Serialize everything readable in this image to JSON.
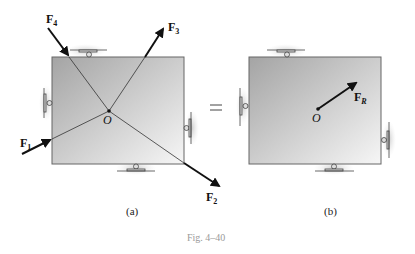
{
  "figure": {
    "caption": "Fig. 4–40",
    "equals_sign": "=",
    "panel_a": {
      "label": "(a)",
      "point_label": "O",
      "forces": [
        {
          "name": "F",
          "sub": "1"
        },
        {
          "name": "F",
          "sub": "2"
        },
        {
          "name": "F",
          "sub": "3"
        },
        {
          "name": "F",
          "sub": "4"
        }
      ]
    },
    "panel_b": {
      "label": "(b)",
      "point_label": "O",
      "resultant": {
        "name": "F",
        "sub": "R"
      }
    },
    "colors": {
      "plate_light": "#f4f4f4",
      "plate_dark": "#a8a8a8",
      "arrow": "#111111",
      "line": "#333333",
      "support_shadow": "#d4d4d4"
    }
  }
}
